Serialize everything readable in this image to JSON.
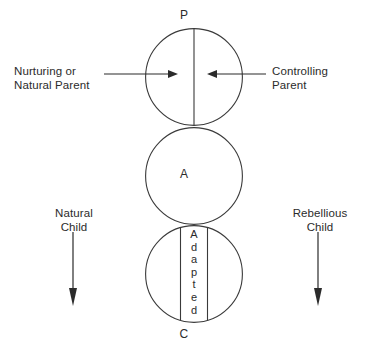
{
  "diagram": {
    "type": "transactional-analysis-pac",
    "colors": {
      "background": "#ffffff",
      "stroke": "#3a3a3a",
      "text": "#2b2b2b",
      "arrow": "#2b2b2b"
    },
    "ego_states": [
      {
        "key": "parent",
        "letter": "P",
        "divided": true,
        "circle": {
          "cx": 194,
          "cy": 77,
          "r": 49
        }
      },
      {
        "key": "adult",
        "letter": "A",
        "divided": false,
        "circle": {
          "cx": 194,
          "cy": 176,
          "r": 49
        }
      },
      {
        "key": "child",
        "letter": "C",
        "divided": false,
        "circle": {
          "cx": 194,
          "cy": 274,
          "r": 49
        }
      }
    ],
    "band": {
      "name": "adapted-band",
      "text": "Adapted",
      "letters": [
        "A",
        "d",
        "a",
        "p",
        "t",
        "e",
        "d"
      ],
      "orientation": "vertical"
    },
    "labels": {
      "parent_letter": "P",
      "adult_letter": "A",
      "child_letter": "C",
      "nurturing": "Nurturing or\nNatural Parent",
      "controlling": "Controlling\nParent",
      "natural_child": "Natural\nChild",
      "rebellious_child": "Rebellious\nChild"
    },
    "arrows": [
      {
        "name": "nurturing-arrow",
        "direction": "right",
        "from": [
          104,
          74
        ],
        "to": [
          178,
          74
        ]
      },
      {
        "name": "controlling-arrow",
        "direction": "left",
        "from": [
          266,
          74
        ],
        "to": [
          207,
          74
        ]
      },
      {
        "name": "natural-child-arrow",
        "direction": "down",
        "from": [
          73,
          232
        ],
        "to": [
          73,
          306
        ]
      },
      {
        "name": "rebellious-child-arrow",
        "direction": "down",
        "from": [
          318,
          232
        ],
        "to": [
          318,
          306
        ]
      }
    ]
  }
}
